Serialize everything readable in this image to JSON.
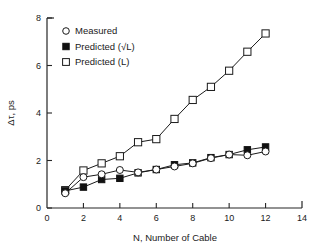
{
  "chart_data": {
    "type": "line",
    "title": "",
    "subtitle": "",
    "xlabel": "N, Number of Cable",
    "ylabel": "Δτ, ps",
    "xlim": [
      0,
      14
    ],
    "ylim": [
      0,
      8
    ],
    "xticks": [
      0,
      2,
      4,
      6,
      8,
      10,
      12,
      14
    ],
    "yticks": [
      0,
      2,
      4,
      6,
      8
    ],
    "xtick_labels": [
      "0",
      "2",
      "4",
      "6",
      "8",
      "10",
      "12",
      "14"
    ],
    "ytick_labels": [
      "0",
      "2",
      "4",
      "6",
      "8"
    ],
    "grid": false,
    "legend_position": "upper-left",
    "x": [
      1,
      2,
      3,
      4,
      5,
      6,
      7,
      8,
      9,
      10,
      11,
      12
    ],
    "series": [
      {
        "name": "Measured",
        "marker": "open-circle",
        "values": [
          0.62,
          1.3,
          1.42,
          1.6,
          1.5,
          1.62,
          1.75,
          1.88,
          2.1,
          2.25,
          2.22,
          2.38
        ]
      },
      {
        "name": "Predicted (√L)",
        "marker": "filled-square",
        "values": [
          0.72,
          0.88,
          1.2,
          1.25,
          1.48,
          1.62,
          1.82,
          1.9,
          2.12,
          2.25,
          2.45,
          2.57
        ]
      },
      {
        "name": "Predicted (L)",
        "marker": "open-square",
        "values": [
          0.75,
          1.58,
          1.88,
          2.18,
          2.77,
          2.9,
          3.75,
          4.55,
          5.1,
          5.78,
          6.58,
          7.35
        ]
      }
    ]
  },
  "legend": {
    "entries": [
      {
        "label": "Measured",
        "marker": "open-circle"
      },
      {
        "label": "Predicted (√L)",
        "marker": "filled-square"
      },
      {
        "label": "Predicted (L)",
        "marker": "open-square"
      }
    ]
  },
  "colors": {
    "ink": "#1a1a1a",
    "axis": "#262626",
    "marker_fill_open": "#ffffff",
    "marker_fill_solid": "#111111",
    "background": "#ffffff"
  }
}
